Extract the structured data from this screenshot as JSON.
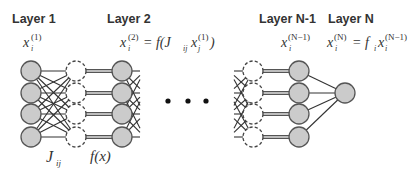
{
  "diagram": {
    "layers": [
      {
        "id": "layer-1",
        "title": "Layer 1",
        "var_base": "x",
        "var_sub": "i",
        "var_sup": "(1)"
      },
      {
        "id": "layer-2",
        "title": "Layer 2",
        "var_base": "x",
        "var_sub": "i",
        "var_sup": "(2)",
        "eq": "= f(J",
        "eq_sub": "ij",
        "eq_rest_base": "x",
        "eq_rest_sub": "j",
        "eq_rest_sup": "(1)",
        "eq_close": ")"
      },
      {
        "id": "layer-n-1",
        "title": "Layer N-1",
        "var_base": "x",
        "var_sub": "i",
        "var_sup": "(N−1)"
      },
      {
        "id": "layer-n",
        "title": "Layer N",
        "var_base": "x",
        "var_sub": "i",
        "var_sup": "(N)",
        "eq": "= f",
        "eq_sub": "i",
        "eq_rest_base": "x",
        "eq_rest_sub": "i",
        "eq_rest_sup": "(N−1)"
      }
    ],
    "annotations": {
      "weights": {
        "base": "J",
        "sub": "ij"
      },
      "activation": "f(x)"
    },
    "ellipsis": "• • •",
    "colors": {
      "node_fill": "#cbcbcb",
      "node_stroke": "#555555",
      "edge": "#333333",
      "text": "#333333"
    },
    "geometry": {
      "node_radius": 10,
      "rows_y": [
        71,
        93,
        114,
        137
      ],
      "columns": {
        "layer1_x": 31,
        "hidden1_dashed_x": 76,
        "layer2_x": 122,
        "layer2_stub_end_x": 140,
        "layerN1_stub_start_x": 234,
        "hiddenN1_dashed_x": 253,
        "layerN1_x": 299,
        "output_x": 345,
        "output_y": 93
      },
      "ellipsis_x": [
        168,
        188,
        206
      ],
      "ellipsis_y": 101
    }
  }
}
